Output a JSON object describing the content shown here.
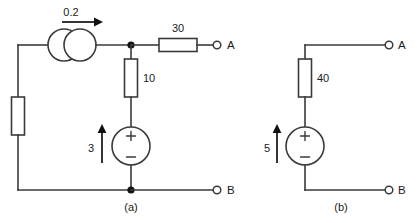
{
  "figure": {
    "type": "circuit-schematic",
    "background": "#ffffff",
    "line_color": "#3a3a3a",
    "text_color": "#1a1a1a"
  },
  "circuit_a": {
    "caption": "(a)",
    "current_source": {
      "value": "0.2",
      "symbol": "two-overlapping-circles",
      "arrow_direction": "right"
    },
    "resistors": [
      {
        "label": "6",
        "orientation": "vertical"
      },
      {
        "label": "10",
        "orientation": "vertical"
      },
      {
        "label": "30",
        "orientation": "horizontal"
      }
    ],
    "voltage_source": {
      "value": "3",
      "plus": "+",
      "minus": "−",
      "arrow_direction": "up"
    },
    "terminals": [
      {
        "label": "A",
        "position": "top-right"
      },
      {
        "label": "B",
        "position": "bottom-right"
      }
    ]
  },
  "circuit_b": {
    "caption": "(b)",
    "resistors": [
      {
        "label": "40",
        "orientation": "vertical"
      }
    ],
    "voltage_source": {
      "value": "5",
      "plus": "+",
      "minus": "−",
      "arrow_direction": "up"
    },
    "terminals": [
      {
        "label": "A",
        "position": "top-right"
      },
      {
        "label": "B",
        "position": "bottom-right"
      }
    ]
  }
}
